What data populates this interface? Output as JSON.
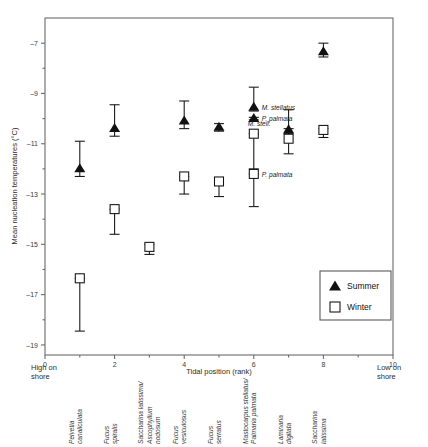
{
  "chart_data": {
    "type": "scatter",
    "title": "",
    "xlabel": "Tidal position (rank)",
    "ylabel": "Mean nucleation temperatures (°C)",
    "xlim": [
      0,
      10
    ],
    "ylim": [
      -19,
      -6
    ],
    "xticks": [
      "0",
      "2",
      "4",
      "6",
      "8",
      "10"
    ],
    "xtick_values": [
      0,
      2,
      4,
      6,
      8,
      10
    ],
    "yticks": [
      "–7",
      "–9",
      "–11",
      "–13",
      "–15",
      "–17",
      "–19"
    ],
    "ytick_values": [
      -7,
      -9,
      -11,
      -13,
      -15,
      -17,
      -19
    ],
    "grid": false,
    "legend_position": "bottom-right",
    "axis_end_labels": {
      "left": "High on\nshore",
      "left_line1": "High on",
      "left_line2": "shore",
      "right_line1": "Low on",
      "right_line2": "shore"
    },
    "category_labels": [
      "Pelvetia\ncanaliculata",
      "Fucus\nspiralis",
      "Saccharina latissima/\nAscophyllum\nnodosum",
      "Fucus\nvesiculosus",
      "Fucus\nserratus",
      "Mastocarpus stellatus/\nPalmaria palmata",
      "Laminaria\ndigitata",
      "Saccharina\nlatissima"
    ],
    "series": [
      {
        "name": "Summer",
        "marker": "triangle",
        "color": "#111111",
        "points": [
          {
            "x": 1,
            "y": -12.0,
            "err_low": -12.3,
            "err_high": -10.9,
            "label": ""
          },
          {
            "x": 2,
            "y": -10.4,
            "err_low": -10.7,
            "err_high": -9.45,
            "label": ""
          },
          {
            "x": 4,
            "y": -10.1,
            "err_low": -10.4,
            "err_high": -9.3,
            "label": ""
          },
          {
            "x": 5,
            "y": -10.35,
            "err_low": -10.5,
            "err_high": -10.2,
            "label": ""
          },
          {
            "x": 6,
            "y": -9.55,
            "err_low": -9.7,
            "err_high": -8.75,
            "label": "M. stellatus"
          },
          {
            "x": 6,
            "y": -10.0,
            "err_low": -10.05,
            "err_high": -9.95,
            "label": "P. palmata"
          },
          {
            "x": 7,
            "y": -10.45,
            "err_low": -10.6,
            "err_high": -9.65,
            "label": ""
          },
          {
            "x": 8,
            "y": -7.35,
            "err_low": -7.55,
            "err_high": -7.0,
            "label": ""
          }
        ]
      },
      {
        "name": "Winter",
        "marker": "square",
        "color": "#ffffff",
        "points": [
          {
            "x": 1,
            "y": -16.35,
            "err_low": -18.45,
            "err_high": -16.35,
            "label": ""
          },
          {
            "x": 2,
            "y": -13.6,
            "err_low": -14.6,
            "err_high": -13.6,
            "label": ""
          },
          {
            "x": 3,
            "y": -15.1,
            "err_low": -15.4,
            "err_high": -15.0,
            "label": ""
          },
          {
            "x": 4,
            "y": -12.3,
            "err_low": -13.0,
            "err_high": -12.3,
            "label": ""
          },
          {
            "x": 5,
            "y": -12.5,
            "err_low": -13.1,
            "err_high": -12.5,
            "label": ""
          },
          {
            "x": 6,
            "y": -10.6,
            "err_low": -12.0,
            "err_high": -10.6,
            "label": "M. stell."
          },
          {
            "x": 6,
            "y": -12.2,
            "err_low": -13.5,
            "err_high": -12.2,
            "label": "P. palmata"
          },
          {
            "x": 7,
            "y": -10.8,
            "err_low": -11.4,
            "err_high": -10.4,
            "label": ""
          },
          {
            "x": 8,
            "y": -10.45,
            "err_low": -10.75,
            "err_high": -10.4,
            "label": ""
          }
        ]
      }
    ],
    "legend": [
      {
        "label": "Summer",
        "marker": "triangle"
      },
      {
        "label": "Winter",
        "marker": "square"
      }
    ]
  }
}
